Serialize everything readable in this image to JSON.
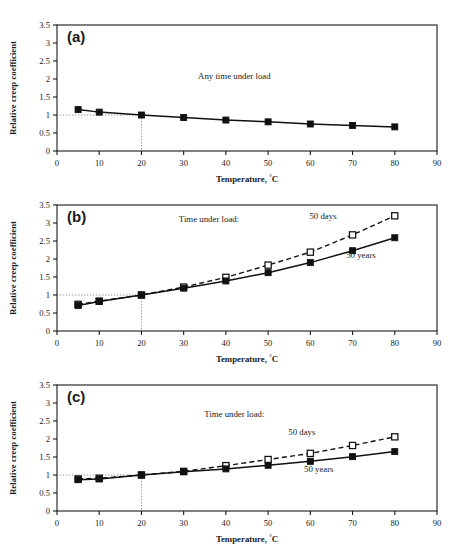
{
  "figure": {
    "background_color": "#ffffff",
    "ink_color": "#111111",
    "reference_line_color": "#8d8d8d",
    "panel_count": 3
  },
  "axes": {
    "xlabel_text": "Temperature, ",
    "xlabel_unit": "°C",
    "ylabel": "Relative creep coefficient",
    "x_ticks": [
      0,
      10,
      20,
      30,
      40,
      50,
      60,
      70,
      80,
      90
    ],
    "y_ticks": [
      0,
      0.5,
      1,
      1.5,
      2,
      2.5,
      3,
      3.5
    ],
    "x_tick_labels": [
      "0",
      "10",
      "20",
      "30",
      "40",
      "50",
      "60",
      "70",
      "80",
      "90"
    ],
    "y_tick_labels": [
      "0",
      "0.5",
      "1",
      "1.5",
      "2",
      "2.5",
      "3",
      "3.5"
    ],
    "xlim": [
      0,
      90
    ],
    "ylim": [
      0,
      3.5
    ],
    "grid": false,
    "reference_x": 20,
    "reference_y": 1
  },
  "legend": {
    "position": "inline-annotation",
    "time_under_load_label": "Time under load:",
    "days_label": "50 days",
    "years_label": "50 years",
    "any_time_label": "Any time under load"
  },
  "chart_data": [
    {
      "type": "line",
      "panel": "a",
      "panel_letter": "(a)",
      "title": "",
      "xlabel": "Temperature, °C",
      "ylabel": "Relative creep coefficient",
      "xlim": [
        0,
        90
      ],
      "ylim": [
        0,
        3.5
      ],
      "grid": false,
      "annotations": [
        "Any time under load"
      ],
      "x": [
        5,
        10,
        20,
        30,
        40,
        50,
        60,
        70,
        80
      ],
      "series": [
        {
          "name": "Any time under load",
          "marker": "filled-square",
          "line": "solid",
          "values": [
            1.15,
            1.08,
            1.0,
            0.93,
            0.86,
            0.81,
            0.75,
            0.71,
            0.67
          ]
        }
      ]
    },
    {
      "type": "line",
      "panel": "b",
      "panel_letter": "(b)",
      "title": "",
      "xlabel": "Temperature, °C",
      "ylabel": "Relative creep coefficient",
      "xlim": [
        0,
        90
      ],
      "ylim": [
        0,
        3.5
      ],
      "grid": false,
      "annotations": [
        "Time under load:",
        "50 days",
        "50 years"
      ],
      "x": [
        5,
        10,
        20,
        30,
        40,
        50,
        60,
        70,
        80
      ],
      "series": [
        {
          "name": "50 days",
          "marker": "open-square",
          "line": "dashed",
          "values": [
            0.74,
            0.83,
            1.0,
            1.22,
            1.49,
            1.83,
            2.19,
            2.67,
            3.2
          ]
        },
        {
          "name": "50 years",
          "marker": "filled-square",
          "line": "solid",
          "values": [
            0.71,
            0.82,
            1.0,
            1.19,
            1.39,
            1.62,
            1.9,
            2.23,
            2.59
          ]
        }
      ]
    },
    {
      "type": "line",
      "panel": "c",
      "panel_letter": "(c)",
      "title": "",
      "xlabel": "Temperature, °C",
      "ylabel": "Relative creep coefficient",
      "xlim": [
        0,
        90
      ],
      "ylim": [
        0,
        3.5
      ],
      "grid": false,
      "annotations": [
        "Time under load:",
        "50 days",
        "50 years"
      ],
      "x": [
        5,
        10,
        20,
        30,
        40,
        50,
        60,
        70,
        80
      ],
      "series": [
        {
          "name": "50 days",
          "marker": "open-square",
          "line": "dashed",
          "values": [
            0.89,
            0.91,
            1.0,
            1.1,
            1.26,
            1.43,
            1.6,
            1.82,
            2.06
          ]
        },
        {
          "name": "50 years",
          "marker": "filled-square",
          "line": "solid",
          "values": [
            0.87,
            0.89,
            1.0,
            1.09,
            1.17,
            1.27,
            1.38,
            1.51,
            1.65
          ]
        }
      ]
    }
  ]
}
